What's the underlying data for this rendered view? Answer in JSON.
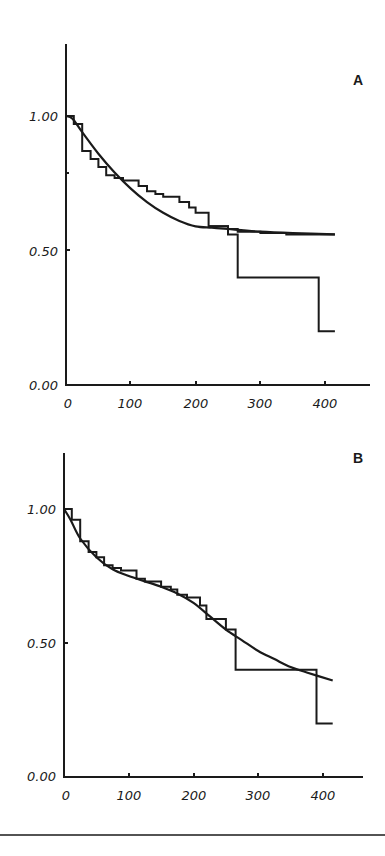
{
  "chart_data": [
    {
      "type": "line",
      "panel": "A",
      "title": "A",
      "xlabel": "",
      "ylabel": "",
      "xlim": [
        0,
        460
      ],
      "ylim": [
        0,
        1.25
      ],
      "x_ticks": [
        "0",
        "100",
        "200",
        "300",
        "400"
      ],
      "y_ticks": [
        "0.00",
        "0.50",
        "1.00"
      ],
      "grid": false,
      "legend": null,
      "series": [
        {
          "name": "step survival estimate",
          "style": "step",
          "points": [
            [
              0,
              1.0
            ],
            [
              12,
              1.0
            ],
            [
              12,
              0.97
            ],
            [
              25,
              0.97
            ],
            [
              25,
              0.87
            ],
            [
              38,
              0.87
            ],
            [
              38,
              0.84
            ],
            [
              50,
              0.84
            ],
            [
              50,
              0.81
            ],
            [
              62,
              0.81
            ],
            [
              62,
              0.78
            ],
            [
              75,
              0.78
            ],
            [
              75,
              0.77
            ],
            [
              88,
              0.77
            ],
            [
              88,
              0.76
            ],
            [
              112,
              0.76
            ],
            [
              112,
              0.74
            ],
            [
              125,
              0.74
            ],
            [
              125,
              0.72
            ],
            [
              138,
              0.72
            ],
            [
              138,
              0.71
            ],
            [
              150,
              0.71
            ],
            [
              150,
              0.7
            ],
            [
              175,
              0.7
            ],
            [
              175,
              0.68
            ],
            [
              190,
              0.68
            ],
            [
              190,
              0.66
            ],
            [
              200,
              0.66
            ],
            [
              200,
              0.64
            ],
            [
              220,
              0.64
            ],
            [
              220,
              0.59
            ],
            [
              250,
              0.59
            ],
            [
              250,
              0.56
            ],
            [
              265,
              0.56
            ],
            [
              265,
              0.4
            ],
            [
              390,
              0.4
            ],
            [
              390,
              0.2
            ],
            [
              415,
              0.2
            ]
          ]
        },
        {
          "name": "second step curve (plateau)",
          "style": "step",
          "points": [
            [
              220,
              0.59
            ],
            [
              250,
              0.59
            ],
            [
              250,
              0.58
            ],
            [
              265,
              0.58
            ],
            [
              265,
              0.57
            ],
            [
              300,
              0.57
            ],
            [
              300,
              0.565
            ],
            [
              340,
              0.565
            ],
            [
              340,
              0.56
            ],
            [
              415,
              0.56
            ]
          ]
        },
        {
          "name": "fitted model",
          "style": "smooth",
          "points": [
            [
              0,
              1.0
            ],
            [
              10,
              0.99
            ],
            [
              25,
              0.94
            ],
            [
              50,
              0.86
            ],
            [
              75,
              0.79
            ],
            [
              100,
              0.73
            ],
            [
              125,
              0.68
            ],
            [
              150,
              0.64
            ],
            [
              175,
              0.61
            ],
            [
              200,
              0.59
            ],
            [
              225,
              0.585
            ],
            [
              250,
              0.58
            ],
            [
              300,
              0.57
            ],
            [
              350,
              0.565
            ],
            [
              415,
              0.56
            ]
          ]
        }
      ]
    },
    {
      "type": "line",
      "panel": "B",
      "title": "B",
      "xlabel": "",
      "ylabel": "",
      "xlim": [
        0,
        460
      ],
      "ylim": [
        0,
        1.25
      ],
      "x_ticks": [
        "0",
        "100",
        "200",
        "300",
        "400"
      ],
      "y_ticks": [
        "0.00",
        "0.50",
        "1.00"
      ],
      "grid": false,
      "legend": null,
      "series": [
        {
          "name": "step survival estimate",
          "style": "step",
          "points": [
            [
              0,
              1.0
            ],
            [
              12,
              1.0
            ],
            [
              12,
              0.96
            ],
            [
              25,
              0.96
            ],
            [
              25,
              0.88
            ],
            [
              38,
              0.88
            ],
            [
              38,
              0.84
            ],
            [
              50,
              0.84
            ],
            [
              50,
              0.82
            ],
            [
              62,
              0.82
            ],
            [
              62,
              0.79
            ],
            [
              75,
              0.79
            ],
            [
              75,
              0.78
            ],
            [
              88,
              0.78
            ],
            [
              88,
              0.77
            ],
            [
              112,
              0.77
            ],
            [
              112,
              0.74
            ],
            [
              125,
              0.74
            ],
            [
              125,
              0.73
            ],
            [
              150,
              0.73
            ],
            [
              150,
              0.71
            ],
            [
              165,
              0.71
            ],
            [
              165,
              0.7
            ],
            [
              175,
              0.7
            ],
            [
              175,
              0.68
            ],
            [
              190,
              0.68
            ],
            [
              190,
              0.67
            ],
            [
              210,
              0.67
            ],
            [
              210,
              0.64
            ],
            [
              220,
              0.64
            ],
            [
              220,
              0.59
            ],
            [
              250,
              0.59
            ],
            [
              250,
              0.55
            ],
            [
              265,
              0.55
            ],
            [
              265,
              0.4
            ],
            [
              390,
              0.4
            ],
            [
              390,
              0.2
            ],
            [
              415,
              0.2
            ]
          ]
        },
        {
          "name": "fitted model",
          "style": "smooth",
          "points": [
            [
              0,
              1.0
            ],
            [
              10,
              0.96
            ],
            [
              25,
              0.89
            ],
            [
              50,
              0.82
            ],
            [
              75,
              0.775
            ],
            [
              100,
              0.75
            ],
            [
              125,
              0.73
            ],
            [
              150,
              0.71
            ],
            [
              175,
              0.685
            ],
            [
              200,
              0.65
            ],
            [
              225,
              0.6
            ],
            [
              250,
              0.55
            ],
            [
              275,
              0.51
            ],
            [
              300,
              0.47
            ],
            [
              325,
              0.44
            ],
            [
              350,
              0.41
            ],
            [
              375,
              0.39
            ],
            [
              415,
              0.36
            ]
          ]
        }
      ]
    }
  ],
  "panels": {
    "a": {
      "label": "A",
      "x_ticks": [
        "0",
        "100",
        "200",
        "300",
        "400"
      ],
      "y_ticks": [
        "1.00",
        "0.50",
        "0.00"
      ]
    },
    "b": {
      "label": "B",
      "x_ticks": [
        "0",
        "100",
        "200",
        "300",
        "400"
      ],
      "y_ticks": [
        "1.00",
        "0.50",
        "0.00"
      ]
    }
  }
}
